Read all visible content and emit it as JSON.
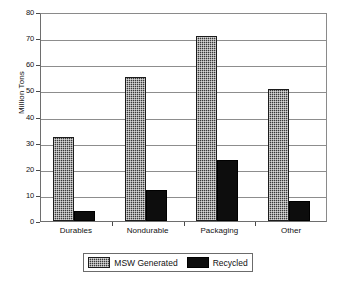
{
  "chart_data": {
    "type": "bar",
    "title": "",
    "subtitle": "",
    "xlabel": "",
    "ylabel": "Million Tons",
    "ylim": [
      0,
      80
    ],
    "yticks": [
      0,
      10,
      20,
      30,
      40,
      50,
      60,
      70,
      80
    ],
    "ytick_labels": [
      "0",
      "10",
      "20",
      "30",
      "40",
      "50",
      "60",
      "70",
      "80"
    ],
    "grid": true,
    "legend_position": "bottom",
    "categories": [
      "Durables",
      "Nondurable",
      "Packaging",
      "Other"
    ],
    "series": [
      {
        "name": "MSW Generated",
        "color": "#3a3a3a",
        "pattern": "cross-hatch",
        "values": [
          32,
          55,
          71,
          50.5
        ]
      },
      {
        "name": "Recycled",
        "color": "#0d0d0d",
        "pattern": "solid",
        "values": [
          4,
          12,
          23.5,
          7.5
        ]
      }
    ]
  },
  "axis": {
    "y_label": "Million Tons"
  },
  "legend": {
    "items": [
      {
        "label": "MSW Generated",
        "swatch": "cross-hatch-swatch"
      },
      {
        "label": "Recycled",
        "swatch": "solid-black-swatch"
      }
    ]
  }
}
